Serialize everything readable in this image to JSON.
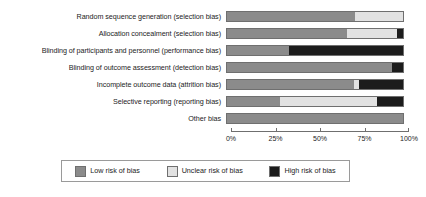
{
  "chart_data": {
    "type": "bar",
    "title": "",
    "subtitle": "",
    "xlabel": "",
    "ylabel": "",
    "orientation": "horizontal",
    "stacked": true,
    "stack_mode": "percent",
    "grid": false,
    "xlim": [
      0,
      100
    ],
    "xticks": [
      0,
      25,
      50,
      75,
      100
    ],
    "xtick_labels": [
      "0%",
      "25%",
      "50%",
      "75%",
      "100%"
    ],
    "legend_position": "bottom",
    "categories": [
      "Random sequence generation (selection bias)",
      "Allocation concealment (selection bias)",
      "Blinding of participants and personnel (performance bias)",
      "Blinding of outcome assessment (detection bias)",
      "Incomplete outcome data (attrition bias)",
      "Selective reporting (reporting bias)",
      "Other bias"
    ],
    "series": [
      {
        "name": "Low risk of bias",
        "color": "#8b8b8b",
        "values": [
          72.5,
          68.0,
          35.5,
          94.0,
          72.0,
          30.0,
          100.0
        ]
      },
      {
        "name": "Unclear risk of bias",
        "color": "#e2e2e2",
        "values": [
          27.5,
          28.6,
          0.0,
          0.0,
          3.0,
          55.0,
          0.0
        ]
      },
      {
        "name": "High risk of bias",
        "color": "#1c1c1c",
        "values": [
          0.0,
          3.4,
          64.5,
          6.0,
          25.0,
          15.0,
          0.0
        ]
      }
    ]
  },
  "axis": {
    "ticks": [
      {
        "label": "0%",
        "value": 0
      },
      {
        "label": "25%",
        "value": 25
      },
      {
        "label": "50%",
        "value": 50
      },
      {
        "label": "75%",
        "value": 75
      },
      {
        "label": "100%",
        "value": 100
      }
    ]
  },
  "legend": {
    "items": [
      {
        "label": "Low risk of bias",
        "color": "#8b8b8b"
      },
      {
        "label": "Unclear risk of bias",
        "color": "#e2e2e2"
      },
      {
        "label": "High risk of bias",
        "color": "#1c1c1c"
      }
    ]
  }
}
